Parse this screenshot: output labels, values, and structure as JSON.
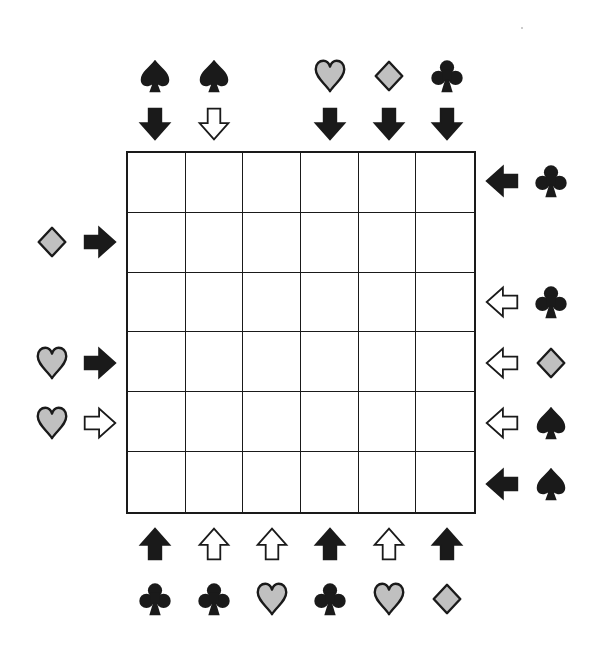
{
  "puzzle": {
    "grid": {
      "rows": 6,
      "cols": 6
    },
    "colors": {
      "ink": "#1a1a1a",
      "gray_fill": "#c0c0c0",
      "background": "#ffffff"
    },
    "clues": {
      "top": [
        {
          "col": 1,
          "suit": "spade",
          "arrow": "down",
          "arrow_style": "filled"
        },
        {
          "col": 2,
          "suit": "spade",
          "arrow": "down",
          "arrow_style": "outline"
        },
        {
          "col": 4,
          "suit": "heart",
          "arrow": "down",
          "arrow_style": "filled"
        },
        {
          "col": 5,
          "suit": "diamond",
          "arrow": "down",
          "arrow_style": "filled"
        },
        {
          "col": 6,
          "suit": "club",
          "arrow": "down",
          "arrow_style": "filled"
        }
      ],
      "bottom": [
        {
          "col": 1,
          "suit": "club",
          "arrow": "up",
          "arrow_style": "filled"
        },
        {
          "col": 2,
          "suit": "club",
          "arrow": "up",
          "arrow_style": "outline"
        },
        {
          "col": 3,
          "suit": "heart",
          "arrow": "up",
          "arrow_style": "outline"
        },
        {
          "col": 4,
          "suit": "club",
          "arrow": "up",
          "arrow_style": "filled"
        },
        {
          "col": 5,
          "suit": "heart",
          "arrow": "up",
          "arrow_style": "outline"
        },
        {
          "col": 6,
          "suit": "diamond",
          "arrow": "up",
          "arrow_style": "filled"
        }
      ],
      "left": [
        {
          "row": 2,
          "suit": "diamond",
          "arrow": "right",
          "arrow_style": "filled"
        },
        {
          "row": 4,
          "suit": "heart",
          "arrow": "right",
          "arrow_style": "filled"
        },
        {
          "row": 5,
          "suit": "heart",
          "arrow": "right",
          "arrow_style": "outline"
        }
      ],
      "right": [
        {
          "row": 1,
          "suit": "club",
          "arrow": "left",
          "arrow_style": "filled"
        },
        {
          "row": 3,
          "suit": "club",
          "arrow": "left",
          "arrow_style": "outline"
        },
        {
          "row": 4,
          "suit": "diamond",
          "arrow": "left",
          "arrow_style": "outline"
        },
        {
          "row": 5,
          "suit": "spade",
          "arrow": "left",
          "arrow_style": "outline"
        },
        {
          "row": 6,
          "suit": "spade",
          "arrow": "left",
          "arrow_style": "filled"
        }
      ]
    }
  }
}
